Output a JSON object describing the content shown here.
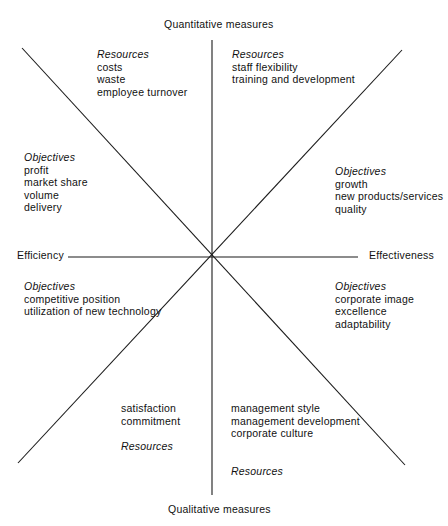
{
  "figure": {
    "line_color": "#1a1a1a",
    "background": "#ffffff"
  },
  "axes": {
    "top_label": "Quantitative measures",
    "bottom_label": "Qualitative measures",
    "left_label": "Efficiency",
    "right_label": "Effectiveness"
  },
  "sectors": {
    "top_left": {
      "heading": "Resources",
      "items": [
        "costs",
        "waste",
        "employee turnover"
      ]
    },
    "top_right": {
      "heading": "Resources",
      "items": [
        "staff flexibility",
        "training and development"
      ]
    },
    "left_upper": {
      "heading": "Objectives",
      "items": [
        "profit",
        "market share",
        "volume",
        "delivery"
      ]
    },
    "right_upper": {
      "heading": "Objectives",
      "items": [
        "growth",
        "new products/services",
        "quality"
      ]
    },
    "left_lower": {
      "heading": "Objectives",
      "items": [
        "competitive position",
        "utilization of new technology"
      ]
    },
    "right_lower": {
      "heading": "Objectives",
      "items": [
        "corporate image",
        "excellence",
        "adaptability"
      ]
    },
    "bottom_left": {
      "heading": "Resources",
      "items": [
        "satisfaction",
        "commitment"
      ]
    },
    "bottom_right": {
      "heading": "Resources",
      "items": [
        "management style",
        "management development",
        "corporate culture"
      ]
    }
  }
}
